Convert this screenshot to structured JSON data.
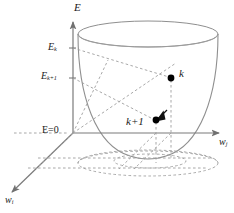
{
  "figure": {
    "background_color": "#ffffff",
    "line_color": "#8c8c8c",
    "dash_color": "#9a9a9a",
    "text_color": "#1a1a1a",
    "point_color": "#000000"
  },
  "axes": {
    "vertical": {
      "name": "energy-axis",
      "label": "E",
      "arrow": "up"
    },
    "horizontal": {
      "name": "wj-axis",
      "label": "w",
      "subscript": "j",
      "arrow": "right"
    },
    "depth": {
      "name": "wi-axis",
      "label": "w",
      "subscript": "i",
      "arrow": "down-left"
    }
  },
  "ticks": [
    {
      "name": "tick-E-k",
      "label": "E",
      "subscript": "k",
      "value": "E_k",
      "y": 48
    },
    {
      "name": "tick-E-k1",
      "label": "E",
      "subscript": "k+1",
      "value": "E_{k+1}",
      "y": 78
    },
    {
      "name": "tick-E-zero",
      "label": "E=0",
      "subscript": "",
      "value": "E=0",
      "y": 133
    }
  ],
  "labels": {
    "energy_axis": "E",
    "energy_k": "E",
    "energy_k_sub": "k",
    "energy_k1": "E",
    "energy_k1_sub": "k+1",
    "energy_zero": "E=0",
    "w_j": "w",
    "w_j_sub": "j",
    "w_i": "w",
    "w_i_sub": "i",
    "point_k": "k",
    "point_k1": "k+1"
  },
  "points": [
    {
      "name": "iterate-k",
      "label": "k",
      "x": 171,
      "y": 78,
      "energy_level": "E_k",
      "description": "current iterate on error surface"
    },
    {
      "name": "iterate-k-plus-1",
      "label": "k+1",
      "x": 156,
      "y": 120,
      "energy_level": "E_{k+1}",
      "description": "next iterate after a descent step"
    }
  ],
  "surface": {
    "name": "paraboloid-bowl",
    "rim_left_x": 78,
    "rim_right_x": 218,
    "rim_center_y": 34,
    "rim_ry": 13,
    "bottom_y": 157,
    "description": "open paraboloid bowl representing the error surface E(w_i, w_j)"
  },
  "arrow_step": {
    "name": "descent-arrow",
    "from_point": "k",
    "to_point": "k+1",
    "description": "arrow indicating descent direction from iterate k to iterate k+1"
  }
}
